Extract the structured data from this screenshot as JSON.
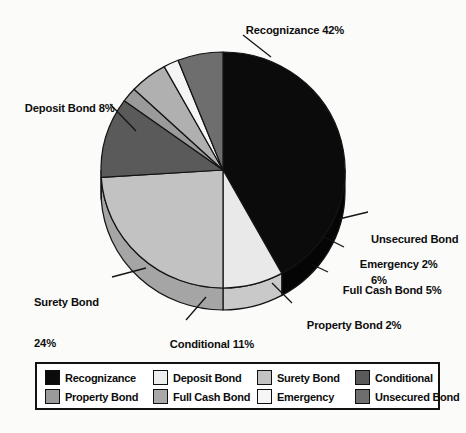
{
  "chart_data": {
    "type": "pie",
    "title": "",
    "subtitle": "",
    "style": "3d-exploded-none",
    "start_angle_deg": -90,
    "direction": "clockwise",
    "categories": [
      "Recognizance",
      "Deposit Bond",
      "Surety Bond",
      "Conditional",
      "Property Bond",
      "Full Cash Bond",
      "Emergency",
      "Unsecured Bond"
    ],
    "values": [
      42,
      8,
      24,
      11,
      2,
      5,
      2,
      6
    ],
    "unit": "%",
    "legend_position": "bottom",
    "grid": false,
    "slices": [
      {
        "name": "Recognizance",
        "value": 42,
        "label": "Recognizance 42%",
        "color": "#0b0b0b",
        "side_color": "#050505"
      },
      {
        "name": "Deposit Bond",
        "value": 8,
        "label": "Deposit Bond 8%",
        "color": "#e9e9e9",
        "side_color": "#c9c9c9"
      },
      {
        "name": "Surety Bond",
        "value": 24,
        "label": "Surety Bond 24%",
        "color": "#c2c2c2",
        "side_color": "#a5a5a5"
      },
      {
        "name": "Conditional",
        "value": 11,
        "label": "Conditional 11%",
        "color": "#5a5a5a",
        "side_color": "#404040"
      },
      {
        "name": "Property Bond",
        "value": 2,
        "label": "Property Bond 2%",
        "color": "#9a9a9a",
        "side_color": "#7d7d7d"
      },
      {
        "name": "Full Cash Bond",
        "value": 5,
        "label": "Full Cash Bond 5%",
        "color": "#b0b0b0",
        "side_color": "#919191"
      },
      {
        "name": "Emergency",
        "value": 2,
        "label": "Emergency 2%",
        "color": "#f4f4f4",
        "side_color": "#d5d5d5"
      },
      {
        "name": "Unsecured Bond",
        "value": 6,
        "label": "Unsecured Bond 6%",
        "color": "#6e6e6e",
        "side_color": "#545454"
      }
    ]
  },
  "callouts": {
    "recognizance": {
      "line1": "Recognizance 42%",
      "line2": ""
    },
    "deposit_bond": {
      "line1": "Deposit Bond 8%",
      "line2": ""
    },
    "surety_bond": {
      "line1": "Surety Bond",
      "line2": "24%"
    },
    "conditional": {
      "line1": "Conditional 11%",
      "line2": ""
    },
    "property_bond": {
      "line1": "Property Bond 2%",
      "line2": ""
    },
    "full_cash_bond": {
      "line1": "Full Cash Bond 5%",
      "line2": ""
    },
    "emergency": {
      "line1": "Emergency 2%",
      "line2": ""
    },
    "unsecured_bond": {
      "line1": "Unsecured Bond",
      "line2": "6%"
    }
  },
  "legend": {
    "items": [
      {
        "label": "Recognizance",
        "color": "#0b0b0b"
      },
      {
        "label": "Deposit Bond",
        "color": "#eeeeee"
      },
      {
        "label": "Surety Bond",
        "color": "#c2c2c2"
      },
      {
        "label": "Conditional",
        "color": "#5a5a5a"
      },
      {
        "label": "Property Bond",
        "color": "#9a9a9a"
      },
      {
        "label": "Full Cash Bond",
        "color": "#a8a8a8"
      },
      {
        "label": "Emergency",
        "color": "#f6f6f6"
      },
      {
        "label": "Unsecured Bond",
        "color": "#6e6e6e"
      }
    ]
  },
  "colors": {
    "background": "#fbfbfa",
    "outline": "#121212",
    "text": "#0d0d0d"
  }
}
